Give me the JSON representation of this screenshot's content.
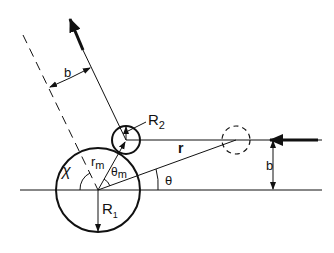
{
  "diagram": {
    "type": "scattering-geometry",
    "colors": {
      "stroke": "#111111",
      "background": "#ffffff"
    },
    "labels": {
      "impact_parameter_top": "b",
      "impact_parameter_right": "b",
      "small_radius": "R",
      "small_radius_sub": "2",
      "large_radius": "R",
      "large_radius_sub": "1",
      "r_m": "r",
      "r_m_sub": "m",
      "theta_m": "θ",
      "theta_m_sub": "m",
      "r_vec": "r",
      "theta": "θ",
      "chi": "χ"
    }
  }
}
